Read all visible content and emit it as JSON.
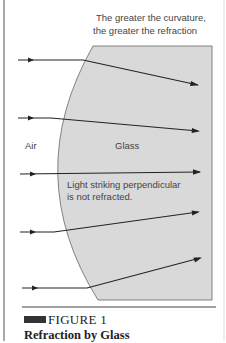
{
  "figure": {
    "annotation_top_line1": "The greater the curvature,",
    "annotation_top_line2": "the greater the refraction",
    "label_air": "Air",
    "label_glass": "Glass",
    "annotation_mid_line1": "Light striking perpendicular",
    "annotation_mid_line2": "is not refracted.",
    "caption_label": "FIGURE 1",
    "caption_title": "Refraction by Glass",
    "colors": {
      "glass_fill": "#d9d9d9",
      "ray": "#222222",
      "text": "#444444",
      "caption_bar": "#333333"
    }
  }
}
